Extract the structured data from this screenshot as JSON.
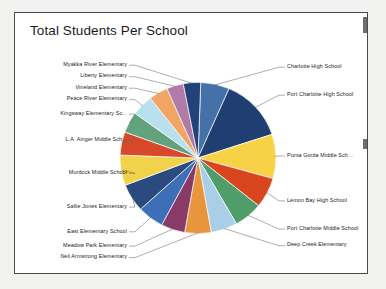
{
  "document": {
    "title": "Total Students Per School"
  },
  "chart_data": {
    "type": "pie",
    "title": "Total Students Per School",
    "xlabel": "",
    "ylabel": "",
    "legend_position": "none",
    "labels_position": "outside-with-leader-lines",
    "grid": false,
    "categories": [
      "Charlotte High School",
      "Port Charlotte High School",
      "Punta Gorda Middle Sch...",
      "Lemon Bay High School",
      "Port Charlotte Middle School",
      "Deep Creek Elementary",
      "Neil Armstrong Elementary",
      "Meadow Park Elementary",
      "East Elementary School",
      "Sallie Jones Elementary",
      "Murdock Middle School",
      "L.A. Ainger Middle Sch...",
      "Kingsway Elementary Sc...",
      "Peace River Elementary",
      "Vineland Elementary",
      "Liberty Elementary",
      "Myakka River Elementary"
    ],
    "values": [
      6.0,
      13.5,
      9.5,
      6.5,
      6.0,
      5.5,
      5.5,
      5.0,
      5.5,
      6.0,
      6.5,
      5.0,
      4.5,
      4.5,
      4.0,
      3.5,
      3.6
    ],
    "colors": [
      "#4472a8",
      "#1f3f73",
      "#f7d247",
      "#d8451f",
      "#4f9e6a",
      "#a9cfe8",
      "#e8963c",
      "#8a3a66",
      "#3c6fb5",
      "#2a4a80",
      "#f2d24b",
      "#d8492a",
      "#62a37e",
      "#b8e0ef",
      "#f1a565",
      "#b07ba8",
      "#23427a"
    ],
    "slices": [
      {
        "label": "Charlotte High School",
        "value": 6.0,
        "color": "#4472a8",
        "side": "right"
      },
      {
        "label": "Port Charlotte High School",
        "value": 13.5,
        "color": "#1f3f73",
        "side": "right"
      },
      {
        "label": "Punta Gorda Middle Sch...",
        "value": 9.5,
        "color": "#f7d247",
        "side": "right"
      },
      {
        "label": "Lemon Bay High School",
        "value": 6.5,
        "color": "#d8451f",
        "side": "right"
      },
      {
        "label": "Port Charlotte Middle School",
        "value": 6.0,
        "color": "#4f9e6a",
        "side": "right"
      },
      {
        "label": "Deep Creek Elementary",
        "value": 5.5,
        "color": "#a9cfe8",
        "side": "right"
      },
      {
        "label": "Neil Armstrong Elementary",
        "value": 5.5,
        "color": "#e8963c",
        "side": "left"
      },
      {
        "label": "Meadow Park Elementary",
        "value": 5.0,
        "color": "#8a3a66",
        "side": "left"
      },
      {
        "label": "East Elementary School",
        "value": 5.5,
        "color": "#3c6fb5",
        "side": "left"
      },
      {
        "label": "Sallie Jones Elementary",
        "value": 6.0,
        "color": "#2a4a80",
        "side": "left"
      },
      {
        "label": "Murdock Middle School",
        "value": 6.5,
        "color": "#f2d24b",
        "side": "left"
      },
      {
        "label": "L.A. Ainger Middle Sch...",
        "value": 5.0,
        "color": "#d8492a",
        "side": "left"
      },
      {
        "label": "Kingsway Elementary Sc...",
        "value": 4.5,
        "color": "#62a37e",
        "side": "left"
      },
      {
        "label": "Peace River Elementary",
        "value": 4.5,
        "color": "#b8e0ef",
        "side": "left"
      },
      {
        "label": "Vineland Elementary",
        "value": 4.0,
        "color": "#f1a565",
        "side": "left"
      },
      {
        "label": "Liberty Elementary",
        "value": 3.5,
        "color": "#b07ba8",
        "side": "left"
      },
      {
        "label": "Myakka River Elementary",
        "value": 3.6,
        "color": "#23427a",
        "side": "left"
      }
    ],
    "start_angle_deg": -88
  }
}
